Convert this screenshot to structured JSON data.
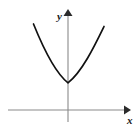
{
  "figure": {
    "kind": "coordinate-plane-parabola",
    "width": 140,
    "height": 131,
    "background_color": "#ffffff"
  },
  "axes": {
    "x_axis": {
      "label": "x",
      "label_x": 127,
      "label_y": 124,
      "line": {
        "x1": 8,
        "y1": 110,
        "x2": 124,
        "y2": 110
      },
      "arrow_points": "124,105.5 131,110 124,114.5",
      "color": "#8a8a8a",
      "width": 1.1,
      "arrow_color": "#2b2b2b"
    },
    "y_axis": {
      "label": "y",
      "label_x": 57,
      "label_y": 20,
      "line": {
        "x1": 68,
        "y1": 122,
        "x2": 68,
        "y2": 16
      },
      "arrow_points": "63.5,16 68,9 72.5,16",
      "color": "#8a8a8a",
      "width": 1.1,
      "arrow_color": "#2b2b2b"
    },
    "label_color": "#1a1a1a"
  },
  "chart_data": {
    "type": "line",
    "title": "",
    "subtitle": "",
    "xlabel": "x",
    "ylabel": "y",
    "grid": false,
    "legend": "none",
    "annotations": [],
    "curve": {
      "name": "parabola",
      "shape": "upward-parabola",
      "vertex_px": [
        68,
        83
      ],
      "vertex_on_axis": "y-axis",
      "opens": "up",
      "crosses_x_axis": false,
      "stroke_color": "#111111",
      "stroke_width": 1.7,
      "path": "M 33.5 24 C 42 45, 54 72, 68 82.8 C 82 72, 94.5 46, 104 26.5",
      "left_endpoint_px": [
        33.5,
        24
      ],
      "right_endpoint_px": [
        104,
        26.5
      ],
      "x_px": [
        33.5,
        41,
        49,
        57,
        62,
        68,
        74,
        80,
        88,
        96,
        104
      ],
      "y_px": [
        24,
        43,
        60,
        74,
        79.5,
        82.8,
        79.5,
        73.5,
        60,
        43.5,
        26.5
      ]
    }
  }
}
